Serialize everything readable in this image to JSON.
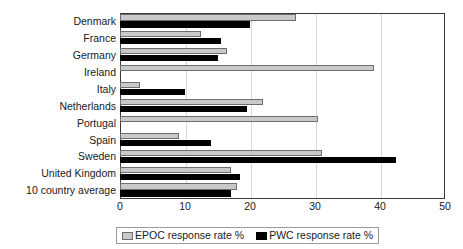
{
  "chart_data": {
    "type": "bar",
    "orientation": "horizontal",
    "title": "",
    "xlabel": "",
    "ylabel": "",
    "xlim": [
      0,
      50
    ],
    "xticks": [
      0,
      10,
      20,
      30,
      40,
      50
    ],
    "grid": true,
    "grid_axis": "x",
    "legend_position": "bottom",
    "categories": [
      "Denmark",
      "France",
      "Germany",
      "Ireland",
      "Italy",
      "Netherlands",
      "Portugal",
      "Spain",
      "Sweden",
      "United Kingdom",
      "10 country average"
    ],
    "series": [
      {
        "name": "EPOC response rate %",
        "color": "#c9c9c9",
        "values": [
          27,
          12.5,
          16.5,
          39,
          3,
          22,
          30.5,
          9,
          31,
          17,
          18
        ]
      },
      {
        "name": "PWC response rate %",
        "color": "#000000",
        "values": [
          20,
          15.5,
          15,
          0,
          10,
          19.5,
          0,
          14,
          42.5,
          18.5,
          17
        ]
      }
    ]
  },
  "legend": {
    "entries": [
      {
        "label": "EPOC response rate %",
        "swatch": "epoc"
      },
      {
        "label": "PWC response rate %",
        "swatch": "pwc"
      }
    ]
  },
  "top_strip": {
    "text": ""
  }
}
